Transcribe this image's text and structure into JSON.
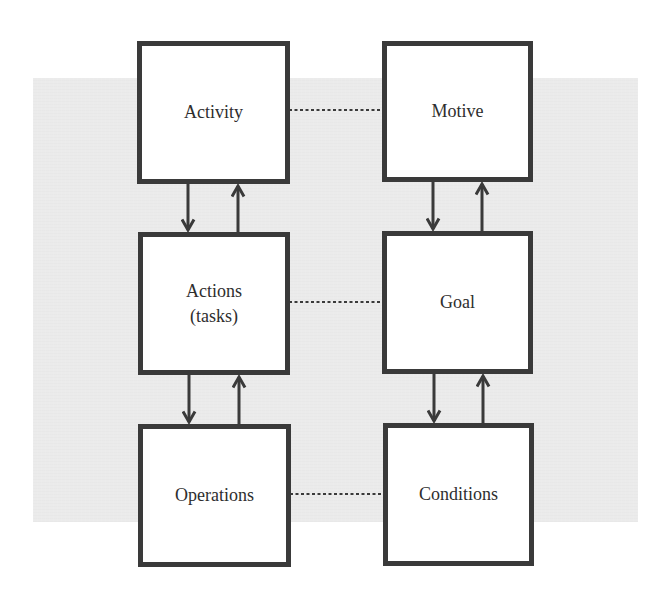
{
  "diagram": {
    "type": "activity-theory-hierarchy",
    "columns": [
      {
        "name": "left",
        "nodes": [
          {
            "id": "activity",
            "label": "Activity"
          },
          {
            "id": "actions",
            "label": "Actions\n(tasks)"
          },
          {
            "id": "operations",
            "label": "Operations"
          }
        ]
      },
      {
        "name": "right",
        "nodes": [
          {
            "id": "motive",
            "label": "Motive"
          },
          {
            "id": "goal",
            "label": "Goal"
          },
          {
            "id": "conditions",
            "label": "Conditions"
          }
        ]
      }
    ],
    "edges": [
      {
        "from": "activity",
        "to": "actions",
        "style": "arrow-down"
      },
      {
        "from": "actions",
        "to": "activity",
        "style": "arrow-up"
      },
      {
        "from": "actions",
        "to": "operations",
        "style": "arrow-down"
      },
      {
        "from": "operations",
        "to": "actions",
        "style": "arrow-up"
      },
      {
        "from": "motive",
        "to": "goal",
        "style": "arrow-down"
      },
      {
        "from": "goal",
        "to": "motive",
        "style": "arrow-up"
      },
      {
        "from": "goal",
        "to": "conditions",
        "style": "arrow-down"
      },
      {
        "from": "conditions",
        "to": "goal",
        "style": "arrow-up"
      },
      {
        "from": "activity",
        "to": "motive",
        "style": "dotted"
      },
      {
        "from": "actions",
        "to": "goal",
        "style": "dotted"
      },
      {
        "from": "operations",
        "to": "conditions",
        "style": "dotted"
      }
    ]
  },
  "colors": {
    "box_border": "#3a3a3a",
    "box_fill": "#ffffff",
    "text": "#2e2e2e",
    "arrow": "#3a3a3a",
    "dotted_line": "#3a3a3a",
    "background_panel": "#ebebeb"
  }
}
